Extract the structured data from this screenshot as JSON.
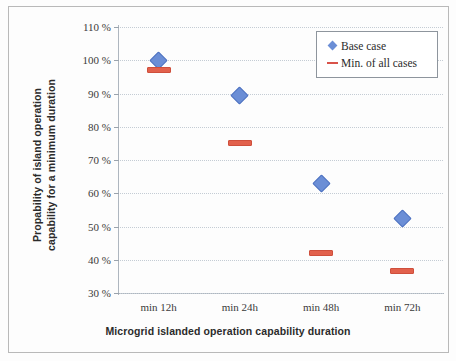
{
  "chart_data": {
    "type": "scatter",
    "title": "",
    "xlabel": "Microgrid islanded operation capability duration",
    "ylabel": "Propability of island operation capability for a minimum duration",
    "ylabel_lines": [
      "Propability of island operation",
      "capability for a minimum duration"
    ],
    "categories": [
      "min 12h",
      "min 24h",
      "min 48h",
      "min 72h"
    ],
    "yticks": [
      "30 %",
      "40 %",
      "50 %",
      "60 %",
      "70 %",
      "80 %",
      "90 %",
      "100 %",
      "110 %"
    ],
    "ytick_values": [
      30,
      40,
      50,
      60,
      70,
      80,
      90,
      100,
      110
    ],
    "ylim": [
      30,
      110
    ],
    "grid": true,
    "legend_position": "top-right",
    "series": [
      {
        "name": "Base case",
        "marker": "diamond",
        "color": "#6b8ed6",
        "values": [
          100,
          89.5,
          63,
          52.5
        ]
      },
      {
        "name": "Min. of all cases",
        "marker": "dash",
        "color": "#e2614c",
        "values": [
          97,
          75,
          42,
          36.5
        ]
      }
    ]
  },
  "legend": {
    "items": [
      {
        "label": "Base case",
        "key": "diamond-marker-icon"
      },
      {
        "label": "Min. of all cases",
        "key": "dash-marker-icon"
      }
    ]
  },
  "colors": {
    "base_case": "#6b8ed6",
    "min_all_cases": "#e2614c",
    "grid": "#c4ccd4",
    "axis": "#aeb6bf",
    "text": "#2b2b2b"
  }
}
